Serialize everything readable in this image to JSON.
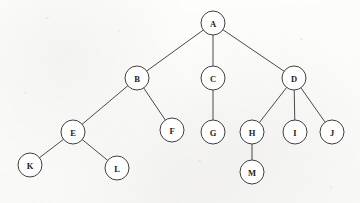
{
  "diagram": {
    "type": "rooted-tree",
    "background_color": "#fdfdfc",
    "node_fill_color": "#ffffff",
    "node_stroke_color": "#3f3f3f",
    "edge_color": "#4a4a4a",
    "label_color": "#1c1c1c",
    "node_radius": 12,
    "nodes": [
      {
        "id": "A",
        "label": "A",
        "x": 213,
        "y": 23,
        "level": 0
      },
      {
        "id": "B",
        "label": "B",
        "x": 137,
        "y": 78,
        "level": 1
      },
      {
        "id": "C",
        "label": "C",
        "x": 213,
        "y": 78,
        "level": 1
      },
      {
        "id": "D",
        "label": "D",
        "x": 294,
        "y": 78,
        "level": 1
      },
      {
        "id": "E",
        "label": "E",
        "x": 73,
        "y": 132,
        "level": 2
      },
      {
        "id": "F",
        "label": "F",
        "x": 172,
        "y": 130,
        "level": 2
      },
      {
        "id": "G",
        "label": "G",
        "x": 213,
        "y": 132,
        "level": 2
      },
      {
        "id": "H",
        "label": "H",
        "x": 252,
        "y": 132,
        "level": 2
      },
      {
        "id": "I",
        "label": "I",
        "x": 295,
        "y": 132,
        "level": 2
      },
      {
        "id": "J",
        "label": "J",
        "x": 332,
        "y": 132,
        "level": 2
      },
      {
        "id": "K",
        "label": "K",
        "x": 30,
        "y": 165,
        "level": 3
      },
      {
        "id": "L",
        "label": "L",
        "x": 117,
        "y": 168,
        "level": 3
      },
      {
        "id": "M",
        "label": "M",
        "x": 252,
        "y": 172,
        "level": 3
      }
    ],
    "edges": [
      {
        "from": "A",
        "to": "B"
      },
      {
        "from": "A",
        "to": "C"
      },
      {
        "from": "A",
        "to": "D"
      },
      {
        "from": "B",
        "to": "E"
      },
      {
        "from": "B",
        "to": "F"
      },
      {
        "from": "C",
        "to": "G"
      },
      {
        "from": "D",
        "to": "H"
      },
      {
        "from": "D",
        "to": "I"
      },
      {
        "from": "D",
        "to": "J"
      },
      {
        "from": "E",
        "to": "K"
      },
      {
        "from": "E",
        "to": "L"
      },
      {
        "from": "H",
        "to": "M"
      }
    ]
  }
}
